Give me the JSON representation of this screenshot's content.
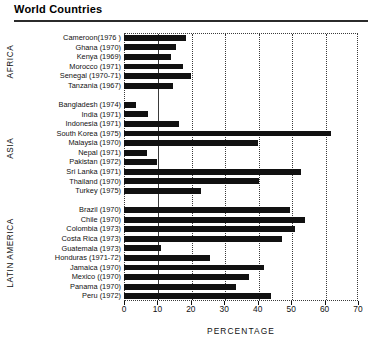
{
  "header": {
    "title": "World Countries"
  },
  "chart_data": {
    "type": "bar",
    "orientation": "horizontal",
    "title": "World Countries",
    "xlabel": "PERCENTAGE",
    "ylabel": "",
    "xlim": [
      0,
      70
    ],
    "xticks": [
      0,
      10,
      20,
      30,
      40,
      50,
      60,
      70
    ],
    "grid": "vertical-dotted",
    "legend": "none",
    "bar_color": "#111111",
    "groups": [
      {
        "name": "AFRICA",
        "categories": [
          "Cameroon(1976 )",
          "Ghana (1970)",
          "Kenya (1969)",
          "Morocco (1971)",
          "Senegal (1970-71)",
          "Tanzania (1967)"
        ],
        "values": [
          18.4,
          15.6,
          14.0,
          17.6,
          20.0,
          14.8
        ]
      },
      {
        "name": "ASIA",
        "categories": [
          "Bangladesh (1974)",
          "India (1971)",
          "Indonesia (1971)",
          "South Korea (1975)",
          "Malaysia (1970)",
          "Nepal (1971)",
          "Pakistan (1972)",
          "Sri Lanka (1971)",
          "Thailand (1970)",
          "Turkey (1975)"
        ],
        "values": [
          3.6,
          7.3,
          16.6,
          62.0,
          40.0,
          6.8,
          9.8,
          53.0,
          40.5,
          23.0
        ]
      },
      {
        "name": "LATIN AMERICA",
        "categories": [
          "Brazil (1970)",
          "Chile (1970)",
          "Colombia (1973)",
          "Costa Rica (1973)",
          "Guatemala (1973)",
          "Honduras (1971-72)",
          "Jamaica (1970)",
          "Mexico ((1970)",
          "Panama (1970)",
          "Peru (1972)"
        ],
        "values": [
          49.7,
          54.0,
          51.2,
          47.4,
          11.0,
          25.7,
          41.9,
          37.5,
          33.5,
          44.0
        ]
      }
    ]
  }
}
